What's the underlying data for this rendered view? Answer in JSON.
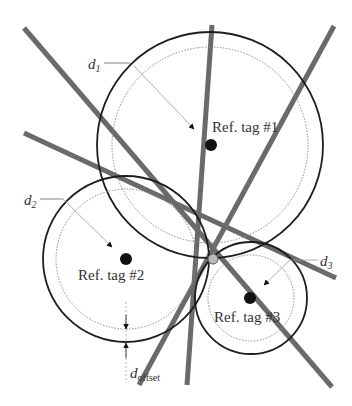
{
  "colors": {
    "line": "#6a6a6a",
    "circle": "#1e1e1e",
    "dotted": "#8a8a8a",
    "tag_dot": "#111111",
    "intersection": "#b9b9b9",
    "text": "#333333"
  },
  "reference_tags": [
    {
      "id": "tag1",
      "label": "Ref. tag #1",
      "distance_label": "d",
      "distance_sub": "1"
    },
    {
      "id": "tag2",
      "label": "Ref. tag #2",
      "distance_label": "d",
      "distance_sub": "2"
    },
    {
      "id": "tag3",
      "label": "Ref. tag #3",
      "distance_label": "d",
      "distance_sub": "3"
    }
  ],
  "offset_label": {
    "main": "d",
    "sub": "offset"
  },
  "estimated_position": "intersection-point"
}
